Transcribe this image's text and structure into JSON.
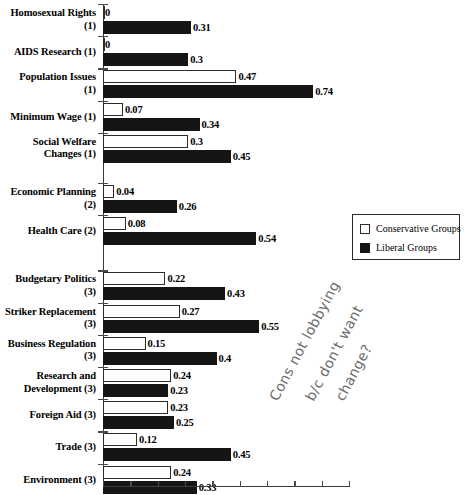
{
  "chart_data": {
    "type": "bar",
    "orientation": "horizontal",
    "title": "",
    "xlabel": "",
    "ylabel": "",
    "xlim": [
      0,
      0.9
    ],
    "grid": false,
    "legend_position": "right",
    "legend": [
      "Conservative Groups",
      "Liberal Groups"
    ],
    "categories": [
      "Homosexual Rights (1)",
      "AIDS Research (1)",
      "Population Issues (1)",
      "Minimum Wage (1)",
      "Social Welfare Changes (1)",
      "Economic Planning (2)",
      "Health Care (2)",
      "Budgetary Politics (3)",
      "Striker Replacement (3)",
      "Business Regulation (3)",
      "Research and Development (3)",
      "Foreign Aid (3)",
      "Trade (3)",
      "Environment (3)"
    ],
    "series": [
      {
        "name": "Conservative Groups",
        "color": "#ffffff",
        "values": [
          0,
          0,
          0.47,
          0.07,
          0.3,
          0.04,
          0.08,
          0.22,
          0.27,
          0.15,
          0.24,
          0.23,
          0.12,
          0.24
        ],
        "labels": [
          "0",
          "0",
          "0.47",
          "0.07",
          "0.3",
          "0.04",
          "0.08",
          "0.22",
          "0.27",
          "0.15",
          "0.24",
          "0.23",
          "0.12",
          "0.24"
        ]
      },
      {
        "name": "Liberal Groups",
        "color": "#151515",
        "values": [
          0.31,
          0.3,
          0.74,
          0.34,
          0.45,
          0.26,
          0.54,
          0.43,
          0.55,
          0.4,
          0.23,
          0.25,
          0.45,
          0.33
        ],
        "labels": [
          "0.31",
          "0.3",
          "0.74",
          "0.34",
          "0.45",
          "0.26",
          "0.54",
          "0.43",
          "0.55",
          "0.4",
          "0.23",
          "0.25",
          "0.45",
          "0.33"
        ]
      }
    ],
    "annotations": [
      {
        "text": "Cons not lobbying",
        "kind": "handwritten"
      },
      {
        "text": "b/c don't want",
        "kind": "handwritten"
      },
      {
        "text": "change?",
        "kind": "handwritten"
      }
    ]
  },
  "categories_display": [
    {
      "line1": "Homosexual Rights",
      "line2": "(1)"
    },
    {
      "line1": "AIDS Research (1)",
      "line2": ""
    },
    {
      "line1": "Population Issues",
      "line2": "(1)"
    },
    {
      "line1": "Minimum Wage (1)",
      "line2": ""
    },
    {
      "line1": "Social Welfare",
      "line2": "Changes (1)"
    },
    {
      "line1": "Economic Planning",
      "line2": "(2)"
    },
    {
      "line1": "Health Care (2)",
      "line2": ""
    },
    {
      "line1": "Budgetary Politics",
      "line2": "(3)"
    },
    {
      "line1": "Striker Replacement",
      "line2": "(3)"
    },
    {
      "line1": "Business Regulation",
      "line2": "(3)"
    },
    {
      "line1": "Research and",
      "line2": "Development (3)"
    },
    {
      "line1": "Foreign Aid (3)",
      "line2": ""
    },
    {
      "line1": "Trade (3)",
      "line2": ""
    },
    {
      "line1": "Environment (3)",
      "line2": ""
    }
  ],
  "legend": {
    "conservative_label": "Conservative Groups",
    "liberal_label": "Liberal Groups"
  },
  "annotation": {
    "line1": "Cons not lobbying",
    "line2": "b/c don't want",
    "line3": "change?"
  },
  "colors": {
    "conservative": "#ffffff",
    "liberal": "#151515",
    "axis": "#3a3a3a",
    "annotation": "#6d6d6d"
  }
}
